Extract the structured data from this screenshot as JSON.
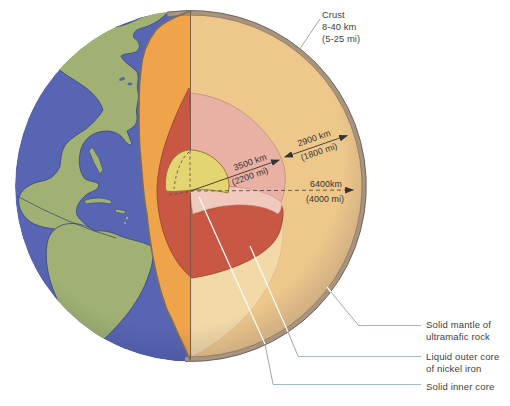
{
  "measurements": {
    "crust": {
      "name": "Crust",
      "km": "8-40 km",
      "mi": "(5-25 mi)"
    },
    "mantle_thickness": {
      "km": "2900 km",
      "mi": "(1800 mi)"
    },
    "core_radius": {
      "km": "3500 km",
      "mi": "(2200 mi)"
    },
    "earth_radius": {
      "km": "6400km",
      "mi": "(4000 mi)"
    }
  },
  "layer_labels": {
    "mantle": {
      "line1": "Solid mantle of",
      "line2": "ultramafic rock"
    },
    "outer_core": {
      "line1": "Liquid outer core",
      "line2": "of nickel iron"
    },
    "inner_core": {
      "line1": "Solid inner core"
    }
  },
  "colors": {
    "ocean": "#5865b2",
    "land": "#a0b173",
    "coast": "#36477f",
    "equator": "#31406f",
    "mantle_surface": "#eec78b",
    "mantle_cut": "#efa44b",
    "mantle_floor": "#f3d9a7",
    "outer_core_face": "#e9b0a4",
    "core_floor": "#f2c9bd",
    "outer_core": "#c85743",
    "inner_core": "#e3d572",
    "crust_band": "#a99482",
    "crust_edge_dark": "#6b5b4a",
    "crust_edge_mid": "#7d6d5a",
    "outline_red": "#96422f",
    "outline_pink": "#b98a78",
    "outline_floor": "#c59a88",
    "outline_yellow": "#8a7530",
    "outline_cream": "#d8b082",
    "meridian": "#6a5a48",
    "measure": "#333333",
    "dash": "#4f4f4f",
    "text": "#3e3e3e",
    "leader_white": "#fbfbf8",
    "leader_gray": "#9b9b99",
    "leader_blue": "#9cb9c5"
  }
}
